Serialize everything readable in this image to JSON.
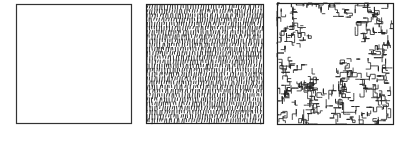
{
  "figure": {
    "panels": [
      {
        "id": "empty-square",
        "description": "Empty square outline",
        "x": 16,
        "y": 4,
        "w": 115,
        "h": 119
      },
      {
        "id": "hatched-square",
        "description": "Square densely filled with short vertical hatch strokes",
        "x": 146,
        "y": 4,
        "w": 117,
        "h": 119
      },
      {
        "id": "fractal-square",
        "description": "Square filled with tangled fractal-like curves with an empty irregular region upper-center",
        "x": 277,
        "y": 3,
        "w": 116,
        "h": 121
      }
    ],
    "colors": {
      "ink": "#222222",
      "background": "#ffffff"
    }
  }
}
